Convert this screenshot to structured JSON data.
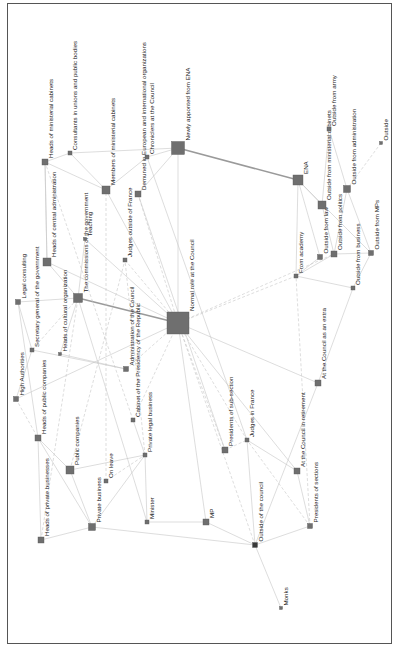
{
  "diagram": {
    "type": "network",
    "orientation": "rotated-90-ccw",
    "colors": {
      "node": "#6f6f6f",
      "edge": "#c6c6c6",
      "edge_strong": "#9a9a9a",
      "frame": "#555555"
    },
    "nodes": [
      {
        "id": "n0",
        "label": "Normal role at the Council",
        "x": 178,
        "y": 323,
        "size": 22
      },
      {
        "id": "n1",
        "label": "Newly apponted from ENA",
        "x": 178,
        "y": 148,
        "size": 13
      },
      {
        "id": "n2",
        "label": "ENA",
        "x": 298,
        "y": 180,
        "size": 10
      },
      {
        "id": "n3",
        "label": "Heads of ministerial cabinets",
        "x": 45,
        "y": 162,
        "size": 6
      },
      {
        "id": "n4",
        "label": "Consultants in unions and public bodies",
        "x": 70,
        "y": 153,
        "size": 4
      },
      {
        "id": "n5",
        "label": "Members of ministerial cabinets",
        "x": 106,
        "y": 190,
        "size": 8
      },
      {
        "id": "n6",
        "label": "Demuned in European and international organizations",
        "x": 138,
        "y": 194,
        "size": 6
      },
      {
        "id": "n7",
        "label": "Chroniclers at the Council",
        "x": 147,
        "y": 157,
        "size": 4
      },
      {
        "id": "n8",
        "label": "Heads of central administration",
        "x": 47,
        "y": 262,
        "size": 8
      },
      {
        "id": "n9",
        "label": "The commissions of the government",
        "x": 78,
        "y": 298,
        "size": 9
      },
      {
        "id": "n10",
        "label": "Teaching",
        "x": 85,
        "y": 239,
        "size": 3
      },
      {
        "id": "n11",
        "label": "Judges outside of France",
        "x": 125,
        "y": 260,
        "size": 4
      },
      {
        "id": "n12",
        "label": "Legal consulting",
        "x": 18,
        "y": 302,
        "size": 5
      },
      {
        "id": "n13",
        "label": "Secretary general of the government",
        "x": 32,
        "y": 350,
        "size": 4
      },
      {
        "id": "n14",
        "label": "Heads of cultural organization",
        "x": 60,
        "y": 354,
        "size": 3
      },
      {
        "id": "n15",
        "label": "High Authorities",
        "x": 16,
        "y": 399,
        "size": 5
      },
      {
        "id": "n16",
        "label": "Administration of the Council",
        "x": 126,
        "y": 369,
        "size": 5
      },
      {
        "id": "n17",
        "label": "Cabinet of the Presidency of the Republic",
        "x": 133,
        "y": 420,
        "size": 4
      },
      {
        "id": "n18",
        "label": "Heads of public companies",
        "x": 38,
        "y": 438,
        "size": 6
      },
      {
        "id": "n19",
        "label": "Public companies",
        "x": 70,
        "y": 470,
        "size": 8
      },
      {
        "id": "n20",
        "label": "Private legal business",
        "x": 145,
        "y": 455,
        "size": 4
      },
      {
        "id": "n21",
        "label": "On leave",
        "x": 106,
        "y": 481,
        "size": 4
      },
      {
        "id": "n22",
        "label": "Private business",
        "x": 92,
        "y": 527,
        "size": 7
      },
      {
        "id": "n23",
        "label": "Heads of private businesses",
        "x": 41,
        "y": 540,
        "size": 6
      },
      {
        "id": "n24",
        "label": "Minister",
        "x": 147,
        "y": 522,
        "size": 4
      },
      {
        "id": "n25",
        "label": "MP",
        "x": 206,
        "y": 522,
        "size": 6
      },
      {
        "id": "n26",
        "label": "Presidents of sub-section",
        "x": 225,
        "y": 450,
        "size": 6
      },
      {
        "id": "n27",
        "label": "Judges in France",
        "x": 247,
        "y": 440,
        "size": 4
      },
      {
        "id": "n28",
        "label": "At the Council in retirement",
        "x": 297,
        "y": 471,
        "size": 6
      },
      {
        "id": "n29",
        "label": "At the Council as an extra",
        "x": 318,
        "y": 383,
        "size": 6
      },
      {
        "id": "n30",
        "label": "Presidents of sections",
        "x": 310,
        "y": 526,
        "size": 5
      },
      {
        "id": "n31",
        "label": "Outside of the council",
        "x": 255,
        "y": 545,
        "size": 5,
        "dark": true
      },
      {
        "id": "n32",
        "label": "Monks",
        "x": 281,
        "y": 608,
        "size": 3
      },
      {
        "id": "n33",
        "label": "From academy",
        "x": 296,
        "y": 276,
        "size": 4
      },
      {
        "id": "n34",
        "label": "Outside from law",
        "x": 320,
        "y": 257,
        "size": 5
      },
      {
        "id": "n35",
        "label": "Outside from politics",
        "x": 334,
        "y": 254,
        "size": 6
      },
      {
        "id": "n36",
        "label": "Outside from business",
        "x": 353,
        "y": 288,
        "size": 4
      },
      {
        "id": "n37",
        "label": "Outside from MPs",
        "x": 371,
        "y": 253,
        "size": 5
      },
      {
        "id": "n38",
        "label": "Outside from administration",
        "x": 347,
        "y": 189,
        "size": 7
      },
      {
        "id": "n39",
        "label": "Outside from ministerial cabinets",
        "x": 322,
        "y": 205,
        "size": 8
      },
      {
        "id": "n40",
        "label": "Outside from army",
        "x": 329,
        "y": 129,
        "size": 4
      },
      {
        "id": "n41",
        "label": "Outside",
        "x": 381,
        "y": 143,
        "size": 3
      }
    ],
    "edges": [
      [
        "n1",
        "n0",
        "solid"
      ],
      [
        "n2",
        "n1",
        "strong"
      ],
      [
        "n9",
        "n0",
        "strong"
      ],
      [
        "n7",
        "n1",
        "solid"
      ],
      [
        "n6",
        "n1",
        "solid"
      ],
      [
        "n4",
        "n1",
        "solid"
      ],
      [
        "n3",
        "n4",
        "solid"
      ],
      [
        "n3",
        "n5",
        "solid"
      ],
      [
        "n4",
        "n5",
        "solid"
      ],
      [
        "n5",
        "n7",
        "solid"
      ],
      [
        "n5",
        "n0",
        "solid"
      ],
      [
        "n6",
        "n0",
        "dash"
      ],
      [
        "n11",
        "n0",
        "dash"
      ],
      [
        "n8",
        "n3",
        "solid"
      ],
      [
        "n8",
        "n9",
        "solid"
      ],
      [
        "n8",
        "n0",
        "solid"
      ],
      [
        "n10",
        "n9",
        "solid"
      ],
      [
        "n10",
        "n0",
        "solid"
      ],
      [
        "n12",
        "n9",
        "solid"
      ],
      [
        "n12",
        "n13",
        "solid"
      ],
      [
        "n13",
        "n9",
        "dash"
      ],
      [
        "n14",
        "n9",
        "solid"
      ],
      [
        "n14",
        "n16",
        "solid"
      ],
      [
        "n15",
        "n0",
        "solid"
      ],
      [
        "n15",
        "n18",
        "dash"
      ],
      [
        "n13",
        "n16",
        "solid"
      ],
      [
        "n16",
        "n0",
        "dash"
      ],
      [
        "n17",
        "n0",
        "dash"
      ],
      [
        "n17",
        "n20",
        "solid"
      ],
      [
        "n18",
        "n19",
        "solid"
      ],
      [
        "n18",
        "n22",
        "solid"
      ],
      [
        "n19",
        "n20",
        "solid"
      ],
      [
        "n19",
        "n22",
        "solid"
      ],
      [
        "n21",
        "n20",
        "dash"
      ],
      [
        "n22",
        "n20",
        "solid"
      ],
      [
        "n22",
        "n23",
        "solid"
      ],
      [
        "n23",
        "n18",
        "solid"
      ],
      [
        "n24",
        "n20",
        "solid"
      ],
      [
        "n24",
        "n25",
        "solid"
      ],
      [
        "n22",
        "n31",
        "solid"
      ],
      [
        "n25",
        "n31",
        "solid"
      ],
      [
        "n26",
        "n27",
        "dash"
      ],
      [
        "n26",
        "n0",
        "dash"
      ],
      [
        "n27",
        "n0",
        "dash"
      ],
      [
        "n28",
        "n0",
        "solid"
      ],
      [
        "n28",
        "n27",
        "solid"
      ],
      [
        "n29",
        "n0",
        "solid"
      ],
      [
        "n29",
        "n36",
        "solid"
      ],
      [
        "n30",
        "n27",
        "dash"
      ],
      [
        "n30",
        "n31",
        "solid"
      ],
      [
        "n30",
        "n28",
        "solid"
      ],
      [
        "n31",
        "n27",
        "solid"
      ],
      [
        "n31",
        "n32",
        "solid"
      ],
      [
        "n31",
        "n29",
        "solid"
      ],
      [
        "n33",
        "n0",
        "dash"
      ],
      [
        "n33",
        "n2",
        "solid"
      ],
      [
        "n33",
        "n34",
        "solid"
      ],
      [
        "n33",
        "n35",
        "solid"
      ],
      [
        "n33",
        "n36",
        "solid"
      ],
      [
        "n34",
        "n2",
        "solid"
      ],
      [
        "n35",
        "n38",
        "solid"
      ],
      [
        "n35",
        "n37",
        "solid"
      ],
      [
        "n36",
        "n37",
        "solid"
      ],
      [
        "n39",
        "n2",
        "solid"
      ],
      [
        "n39",
        "n40",
        "solid"
      ],
      [
        "n38",
        "n40",
        "solid"
      ],
      [
        "n39",
        "n35",
        "solid"
      ],
      [
        "n37",
        "n38",
        "solid"
      ],
      [
        "n24",
        "n9",
        "solid"
      ],
      [
        "n23",
        "n9",
        "dash"
      ],
      [
        "n21",
        "n5",
        "dash"
      ],
      [
        "n20",
        "n11",
        "dash"
      ],
      [
        "n25",
        "n0",
        "solid"
      ],
      [
        "n31",
        "n0",
        "dash"
      ],
      [
        "n41",
        "n38",
        "dash"
      ],
      [
        "n3",
        "n8",
        "solid"
      ],
      [
        "n12",
        "n18",
        "solid"
      ],
      [
        "n15",
        "n13",
        "solid"
      ],
      [
        "n6",
        "n26",
        "solid"
      ],
      [
        "n7",
        "n27",
        "solid"
      ],
      [
        "n0",
        "n35",
        "dash"
      ],
      [
        "n2",
        "n37",
        "solid"
      ],
      [
        "n30",
        "n33",
        "dash"
      ],
      [
        "n19",
        "n11",
        "dash"
      ],
      [
        "n17",
        "n3",
        "dash"
      ]
    ]
  }
}
